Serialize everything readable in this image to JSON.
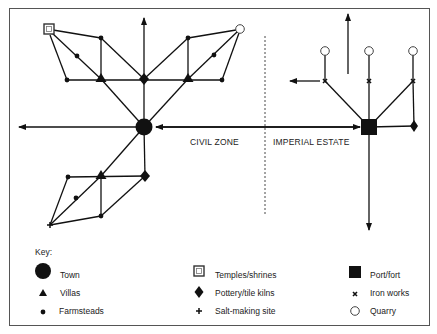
{
  "diagram": {
    "zones": {
      "civil": "CIVIL ZONE",
      "imperial": "IMPERIAL ESTATE"
    },
    "colors": {
      "ink": "#111111",
      "frame": "#555555",
      "background": "#ffffff"
    },
    "nodes": [
      {
        "id": "town",
        "type": "town",
        "x": 144,
        "y": 127
      },
      {
        "id": "kiln-north",
        "type": "pottery-kiln",
        "x": 144,
        "y": 79
      },
      {
        "id": "villa-nw",
        "type": "villa",
        "x": 101,
        "y": 79
      },
      {
        "id": "villa-ne",
        "type": "villa",
        "x": 188,
        "y": 79
      },
      {
        "id": "temple",
        "type": "temple",
        "x": 49,
        "y": 29
      },
      {
        "id": "quarry-civil",
        "type": "quarry",
        "x": 240,
        "y": 29
      },
      {
        "id": "farm-1",
        "type": "farmstead",
        "x": 101,
        "y": 38
      },
      {
        "id": "farm-2",
        "type": "farmstead",
        "x": 77,
        "y": 56
      },
      {
        "id": "farm-3",
        "type": "farmstead",
        "x": 67,
        "y": 80
      },
      {
        "id": "farm-4",
        "type": "farmstead",
        "x": 188,
        "y": 38
      },
      {
        "id": "farm-5",
        "type": "farmstead",
        "x": 214,
        "y": 55
      },
      {
        "id": "farm-6",
        "type": "farmstead",
        "x": 222,
        "y": 80
      },
      {
        "id": "villa-s",
        "type": "villa",
        "x": 101,
        "y": 176
      },
      {
        "id": "kiln-south",
        "type": "pottery-kiln",
        "x": 145,
        "y": 176
      },
      {
        "id": "farm-7",
        "type": "farmstead",
        "x": 68,
        "y": 177
      },
      {
        "id": "farm-8",
        "type": "farmstead",
        "x": 76,
        "y": 198
      },
      {
        "id": "farm-9",
        "type": "farmstead",
        "x": 101,
        "y": 216
      },
      {
        "id": "salt",
        "type": "salt-making-site",
        "x": 50,
        "y": 225
      },
      {
        "id": "port",
        "type": "port-fort",
        "x": 369,
        "y": 127
      },
      {
        "id": "kiln-east",
        "type": "pottery-kiln",
        "x": 414,
        "y": 126
      },
      {
        "id": "iron-1",
        "type": "iron-works",
        "x": 325,
        "y": 81
      },
      {
        "id": "iron-2",
        "type": "iron-works",
        "x": 369,
        "y": 81
      },
      {
        "id": "iron-3",
        "type": "iron-works",
        "x": 413,
        "y": 81
      },
      {
        "id": "quarry-1",
        "type": "quarry",
        "x": 325,
        "y": 51
      },
      {
        "id": "quarry-2",
        "type": "quarry",
        "x": 369,
        "y": 51
      },
      {
        "id": "quarry-3",
        "type": "quarry",
        "x": 413,
        "y": 51
      }
    ]
  },
  "key": {
    "title": "Key:",
    "items": [
      {
        "symbol": "town",
        "label": "Town"
      },
      {
        "symbol": "villa",
        "label": "Villas"
      },
      {
        "symbol": "farmstead",
        "label": "Farmsteads"
      },
      {
        "symbol": "temple",
        "label": "Temples/shrines"
      },
      {
        "symbol": "pottery-kiln",
        "label": "Pottery/tile kilns"
      },
      {
        "symbol": "salt-making-site",
        "label": "Salt-making site"
      },
      {
        "symbol": "port-fort",
        "label": "Port/fort"
      },
      {
        "symbol": "iron-works",
        "label": "Iron works"
      },
      {
        "symbol": "quarry",
        "label": "Quarry"
      }
    ]
  }
}
